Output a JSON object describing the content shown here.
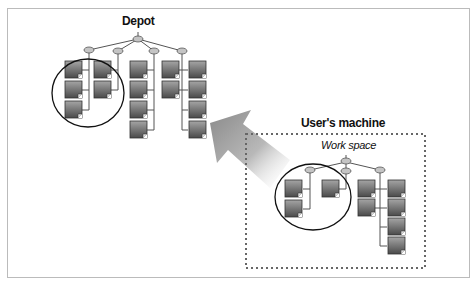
{
  "diagram": {
    "depot": {
      "title": "Depot"
    },
    "users_machine": {
      "title": "User's machine",
      "workspace_label": "Work space"
    },
    "arrow": {
      "direction": "from user's machine work space toward depot",
      "meaning": "submit"
    },
    "colors": {
      "file_fill_top": "#9a9a9a",
      "file_fill_bottom": "#4f4f4f",
      "node_fill": "#bdbdbd",
      "line": "#555555",
      "frame": "#bbbbbb",
      "dotted_box": "#666666"
    }
  }
}
